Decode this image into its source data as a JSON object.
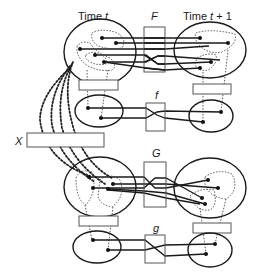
{
  "diagram": {
    "labels": {
      "time_t_prefix": "Time ",
      "time_t_var": "t",
      "time_t1_prefix": "Time ",
      "time_t1_var": "t",
      "time_t1_suffix": " + 1",
      "F": "F",
      "f": "f",
      "G": "G",
      "g": "g",
      "X": "X"
    },
    "rows": [
      {
        "map": "F",
        "kind": "large state space",
        "time_t_points": 5,
        "time_t1_points": 4
      },
      {
        "map": "f",
        "kind": "coarse-grained state space",
        "time_t_points": 2,
        "time_t1_points": 2
      },
      {
        "map": "G",
        "kind": "large state space",
        "time_t_points": 4,
        "time_t1_points": 4
      },
      {
        "map": "g",
        "kind": "coarse-grained state space",
        "time_t_points": 2,
        "time_t1_points": 2
      }
    ],
    "colors": {
      "stroke": "#1a1a1a",
      "box_stroke": "#555555",
      "background": "#ffffff"
    }
  }
}
